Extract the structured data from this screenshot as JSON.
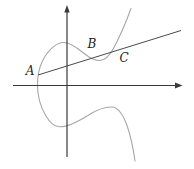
{
  "figure": {
    "background_color": "#ffffff",
    "label_color": "#222222",
    "axes": {
      "color": "#3a3a3a",
      "stroke_width": 1.2,
      "x_axis": {
        "y": 85.5,
        "x_start": 13,
        "x_end": 176,
        "arrow": "182.5,85.5 175,82.6 175,88.4"
      },
      "y_axis": {
        "x": 67,
        "y_start": 157,
        "y_end": 11.5,
        "arrow": "67,5 64.3,12.5 69.7,12.5"
      }
    },
    "curve": {
      "color": "#a8a8a8",
      "stroke_width": 1.1,
      "path": "M 131 8.5 C 126.5 21 119.5 37 114 47.5 C 109.5 56 104.5 60.5 99.5 60.5 C 94.5 60.5 90 58 85.5 54.5 C 79 49.5 71.5 42.5 64 42.5 C 56 42.5 47 51 42 62 C 39 68.5 37.5 77 37.5 85 C 37.5 95 40.5 107 46 116 C 49.5 122 54 126.5 59 126.8 C 67.5 127.2 78.5 121.5 89.5 114.5 C 97 109.8 105.5 106.8 112 107 C 118.5 107.2 123 114.5 127 125.5 C 130.5 135.5 133.5 150 135 161"
    },
    "secant_line": {
      "color": "#4a4a4a",
      "stroke_width": 1,
      "x1": 38,
      "y1": 75,
      "x2": 181,
      "y2": 30.5
    },
    "labels": [
      {
        "text": "A",
        "x": 30,
        "y": 74.5,
        "font_size": 12
      },
      {
        "text": "B",
        "x": 92,
        "y": 48,
        "font_size": 12
      },
      {
        "text": "C",
        "x": 124,
        "y": 61.5,
        "font_size": 12
      }
    ]
  }
}
